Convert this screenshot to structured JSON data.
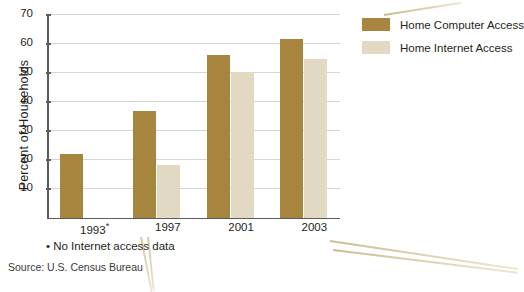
{
  "chart_data": {
    "type": "bar",
    "title": "",
    "xlabel": "",
    "ylabel": "Percent of Households",
    "categories": [
      "1993*",
      "1997",
      "2001",
      "2003"
    ],
    "ylim": [
      0,
      70
    ],
    "yticks": [
      10,
      20,
      30,
      40,
      50,
      60,
      70
    ],
    "grid": true,
    "legend_position": "right",
    "series": [
      {
        "name": "Home Computer Access",
        "color": "#a8853f",
        "values": [
          22,
          36.5,
          56,
          61.5
        ]
      },
      {
        "name": "Home Internet Access",
        "color": "#e2d9c2",
        "values": [
          null,
          18,
          50,
          54.5
        ]
      }
    ],
    "annotations": {
      "footnote": "• No Internet access data",
      "source": "Source: U.S. Census Bureau"
    }
  },
  "legend": {
    "items": [
      {
        "label": "Home Computer Access",
        "swatch": "dark"
      },
      {
        "label": "Home Internet Access",
        "swatch": "light"
      }
    ]
  }
}
